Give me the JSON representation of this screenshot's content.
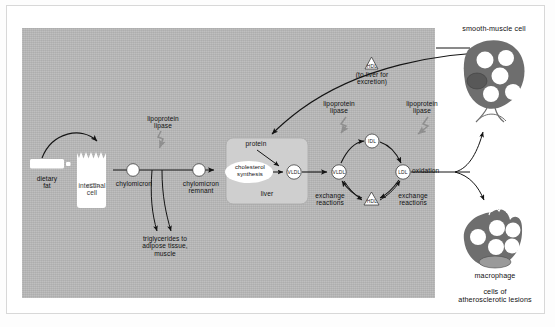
{
  "figure": {
    "panel_bg": "#b9b9b9",
    "cell_fill": "#6e6e6e",
    "enzyme_arrow_color": "#8f8f8f"
  },
  "pathway": {
    "dietary_fat": "dietary\nfat",
    "intestinal_cell": "intestinal\ncell",
    "chylomicron": "chylomicron",
    "chylomicron_remnant": "chylomicron\nremnant",
    "lipoprotein_lipase_1": "lipoprotein\nlipase",
    "triglycerides": "triglycerides to\nadipose tissue,\nmuscle"
  },
  "liver": {
    "label": "liver",
    "protein": "protein",
    "cholesterol_synthesis": "cholesterol\nsynthesis",
    "vldl_out": "VLDL"
  },
  "cycle": {
    "vldl": "VLDL",
    "idl": "IDL",
    "ldl": "LDL",
    "hdl": "HDL",
    "hdl_top": "HDL",
    "hdl_note": "(to liver for\nexcretion)",
    "lipoprotein_lipase_2": "lipoprotein\nlipase",
    "lipoprotein_lipase_3": "lipoprotein\nlipase",
    "exchange_left": "exchange\nreactions",
    "exchange_right": "exchange\nreactions",
    "oxidation": "oxidation"
  },
  "cells": {
    "smooth_muscle": "smooth-muscle cell",
    "macrophage": "macrophage",
    "caption": "cells of\natherosclerotic lesions"
  }
}
